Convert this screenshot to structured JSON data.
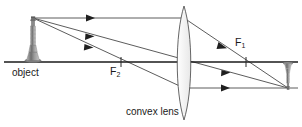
{
  "diagram": {
    "type": "optics-ray-diagram",
    "width": 302,
    "height": 127,
    "background_color": "#ffffff",
    "line_color": "#333333",
    "axis_color": "#1a1a1a",
    "lens_fill": "#f2f2f2",
    "labels": {
      "object": "object",
      "convex_lens": "convex lens",
      "focal_near": "F",
      "focal_near_sub": "2",
      "focal_far": "F",
      "focal_far_sub": "1"
    },
    "geometry": {
      "axis_y": 62,
      "axis_x_start": 4,
      "axis_x_end": 298,
      "lens_center_x": 184,
      "lens_top_y": 6,
      "lens_bottom_y": 120,
      "lens_half_width": 9,
      "object_base_x": 33,
      "object_top_y": 18,
      "object_height": 44,
      "image_base_x": 288,
      "image_bottom_y": 88,
      "image_height": 26,
      "focal_near_x": 121,
      "focal_far_x": 246,
      "tick_half_height": 5
    },
    "rays": [
      {
        "name": "parallel-ray",
        "description": "parallel to axis then through far focal point",
        "points": [
          [
            33,
            18
          ],
          [
            184,
            18
          ],
          [
            288,
            88
          ]
        ],
        "arrow_at": [
          90,
          18
        ]
      },
      {
        "name": "center-ray",
        "description": "straight through lens optical center",
        "points": [
          [
            33,
            18
          ],
          [
            288,
            88
          ]
        ],
        "arrow_at": [
          90,
          38
        ]
      },
      {
        "name": "focal-ray",
        "description": "through near focal point then parallel to axis",
        "points": [
          [
            33,
            18
          ],
          [
            184,
            88
          ],
          [
            298,
            88
          ]
        ],
        "arrow_at": [
          90,
          60
        ]
      }
    ],
    "arrows": [
      {
        "name": "arrow-parallel-incident",
        "x": 90,
        "y": 18,
        "angle": 0
      },
      {
        "name": "arrow-center-incident",
        "x": 90,
        "y": 38,
        "angle": 15
      },
      {
        "name": "arrow-focal-incident",
        "x": 90,
        "y": 50,
        "angle": 25
      },
      {
        "name": "arrow-refracted-to-f1",
        "x": 224,
        "y": 46,
        "angle": 34
      },
      {
        "name": "arrow-center-refracted",
        "x": 228,
        "y": 75,
        "angle": 15
      },
      {
        "name": "arrow-parallel-exit",
        "x": 228,
        "y": 88,
        "angle": 0
      }
    ]
  }
}
